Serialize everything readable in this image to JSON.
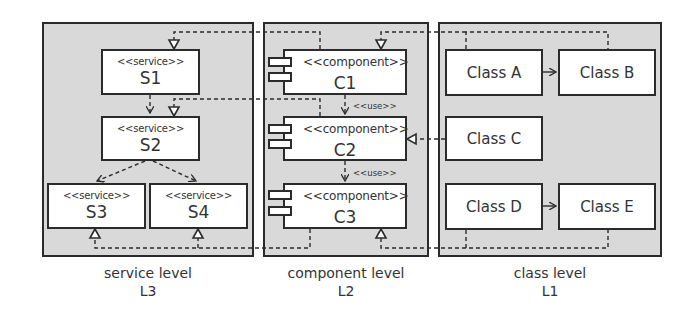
{
  "diagram": {
    "levels": [
      {
        "id": "L3",
        "title": "service level",
        "code": "L3",
        "elements": [
          {
            "id": "S1",
            "stereotype": "<<service>>",
            "name": "S1"
          },
          {
            "id": "S2",
            "stereotype": "<<service>>",
            "name": "S2"
          },
          {
            "id": "S3",
            "stereotype": "<<service>>",
            "name": "S3"
          },
          {
            "id": "S4",
            "stereotype": "<<service>>",
            "name": "S4"
          }
        ]
      },
      {
        "id": "L2",
        "title": "component level",
        "code": "L2",
        "elements": [
          {
            "id": "C1",
            "stereotype": "<<component>>",
            "name": "C1"
          },
          {
            "id": "C2",
            "stereotype": "<<component>>",
            "name": "C2"
          },
          {
            "id": "C3",
            "stereotype": "<<component>>",
            "name": "C3"
          }
        ]
      },
      {
        "id": "L1",
        "title": "class level",
        "code": "L1",
        "elements": [
          {
            "id": "A",
            "name": "Class A"
          },
          {
            "id": "B",
            "name": "Class B"
          },
          {
            "id": "C",
            "name": "Class C"
          },
          {
            "id": "D",
            "name": "Class D"
          },
          {
            "id": "E",
            "name": "Class E"
          }
        ]
      }
    ],
    "relations": [
      {
        "from": "S1",
        "to": "S2",
        "type": "dependency"
      },
      {
        "from": "S2",
        "to": "S3",
        "type": "dependency"
      },
      {
        "from": "S2",
        "to": "S4",
        "type": "dependency"
      },
      {
        "from": "C1",
        "to": "C2",
        "type": "dependency",
        "label": "<<use>>"
      },
      {
        "from": "C2",
        "to": "C3",
        "type": "dependency",
        "label": "<<use>>"
      },
      {
        "from": "Class A",
        "to": "Class B",
        "type": "association"
      },
      {
        "from": "Class D",
        "to": "Class E",
        "type": "association"
      },
      {
        "from": "C1",
        "to": "S1",
        "type": "realization"
      },
      {
        "from": "C2",
        "to": "S2",
        "type": "realization"
      },
      {
        "from": "C3",
        "to": "S3",
        "type": "realization"
      },
      {
        "from": "C3",
        "to": "S4",
        "type": "realization"
      },
      {
        "from": "Class A + Class B",
        "to": "C1",
        "type": "realization"
      },
      {
        "from": "Class C",
        "to": "C2",
        "type": "realization"
      },
      {
        "from": "Class D + Class E",
        "to": "C3",
        "type": "realization"
      }
    ],
    "colors": {
      "panel_fill": "#d9d9d9",
      "stroke": "#2b2b2b",
      "box_fill": "#ffffff"
    }
  }
}
